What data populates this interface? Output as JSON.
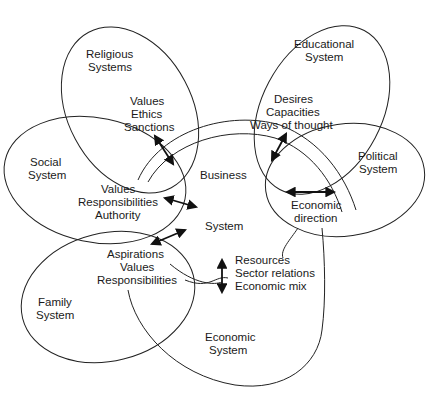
{
  "diagram": {
    "type": "overlapping-systems",
    "center": {
      "line1": "Business",
      "line2": "System"
    },
    "systems": {
      "religious": {
        "title1": "Religious",
        "title2": "Systems",
        "items": [
          "Values",
          "Ethics",
          "Sanctions"
        ]
      },
      "educational": {
        "title1": "Educational",
        "title2": "System",
        "items": [
          "Desires",
          "Capacities",
          "Ways of thought"
        ]
      },
      "social": {
        "title1": "Social",
        "title2": "System",
        "items": [
          "Values",
          "Responsibilities",
          "Authority"
        ]
      },
      "political": {
        "title1": "Political",
        "title2": "System",
        "items": [
          "Economic",
          "direction"
        ]
      },
      "family": {
        "title1": "Family",
        "title2": "System",
        "items": [
          "Aspirations",
          "Values",
          "Responsibilities"
        ]
      },
      "economic": {
        "title1": "Economic",
        "title2": "System",
        "items": [
          "Resources",
          "Sector relations",
          "Economic mix"
        ]
      }
    },
    "relations": [
      {
        "from": "business",
        "to": "religious",
        "style": "double-arrow"
      },
      {
        "from": "business",
        "to": "educational",
        "style": "double-arrow"
      },
      {
        "from": "business",
        "to": "social",
        "style": "double-arrow"
      },
      {
        "from": "business",
        "to": "political",
        "style": "double-arrow"
      },
      {
        "from": "business",
        "to": "family",
        "style": "double-arrow"
      },
      {
        "from": "business",
        "to": "economic",
        "style": "double-arrow"
      }
    ],
    "colors": {
      "line": "#222222",
      "text": "#1a1a1a",
      "background": "#ffffff"
    }
  }
}
